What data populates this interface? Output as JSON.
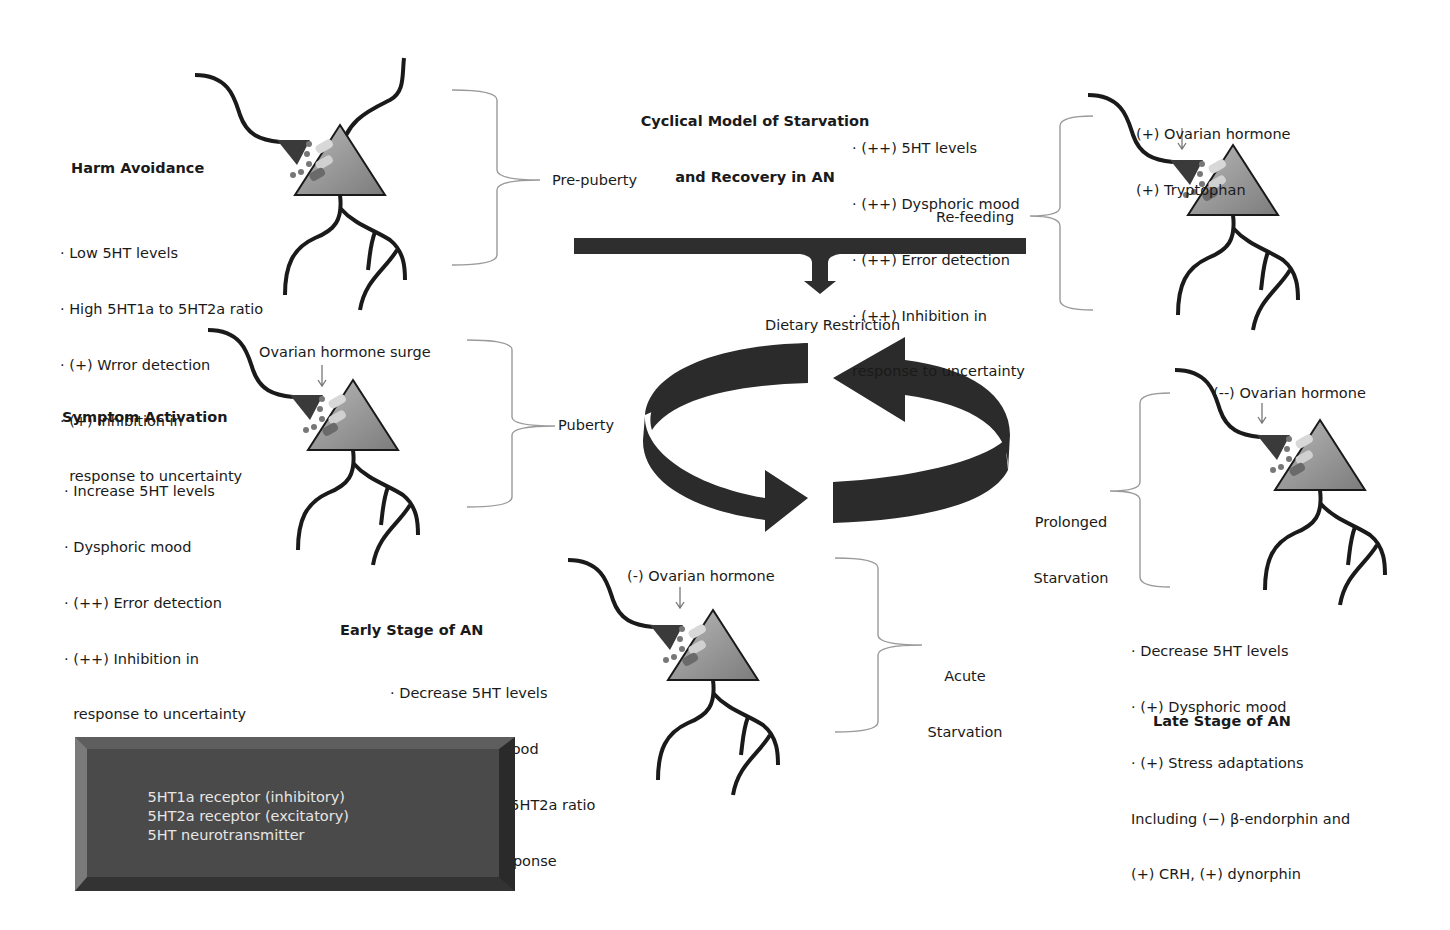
{
  "title": {
    "line1": "Cyclical Model of Starvation",
    "line2": "and Recovery in AN"
  },
  "harm_avoidance": {
    "heading": "Harm Avoidance",
    "items": [
      "· Low 5HT levels",
      "· High 5HT1a to 5HT2a ratio",
      "· (+) Wrror detection",
      "· (+) Inhibition in",
      "  response to uncertainty"
    ]
  },
  "symptom_activation": {
    "heading": "Symptom Activation",
    "hormone_label": "Ovarian hormone surge",
    "items": [
      "· Increase 5HT levels",
      "· Dysphoric mood",
      "· (++) Error detection",
      "· (++) Inhibition in",
      "  response to uncertainty"
    ]
  },
  "early_stage": {
    "heading": "Early Stage of AN",
    "hormone_label": "(-) Ovarian hormone",
    "items": [
      "· Decrease 5HT levels",
      "· (-) Dysphoric mood",
      "· (++) 5HT1a to 5HT2a ratio",
      "· (++) Opioid response"
    ]
  },
  "refeeding": {
    "hormone_line1": "(+) Ovarian hormone",
    "hormone_line2": "(+) Tryptophan",
    "items": [
      "· (++) 5HT levels",
      "· (++) Dysphoric mood",
      "· (++) Error detection",
      "· (++) Inhibition in",
      "response to uncertainty"
    ]
  },
  "late_stage": {
    "heading": "Late Stage of AN",
    "hormone_label": "(--) Ovarian hormone",
    "items": [
      "· Decrease 5HT levels",
      "· (+) Dysphoric mood",
      "· (+) Stress adaptations",
      "Including (−) β-endorphin and",
      "(+) CRH, (+) dynorphin"
    ]
  },
  "phases": {
    "pre_puberty": "Pre-puberty",
    "puberty": "Puberty",
    "acute_line1": "Acute",
    "acute_line2": "Starvation",
    "prolonged_line1": "Prolonged",
    "prolonged_line2": "Starvation",
    "refeeding": "Re-feeding"
  },
  "cycle": {
    "label": "Dietary Restriction"
  },
  "legend": {
    "items": [
      {
        "icon": "receptor-inhibitory-icon",
        "label": "5HT1a receptor (inhibitory)"
      },
      {
        "icon": "receptor-excitatory-icon",
        "label": "5HT2a receptor (excitatory)"
      },
      {
        "icon": "neurotransmitter-icon",
        "label": "5HT neurotransmitter"
      }
    ]
  },
  "colors": {
    "ink": "#1a1a1a",
    "arrow_dark": "#2b2b2b",
    "neuron_body": "#8c8c8c",
    "terminal": "#3a3a3a",
    "bracket": "#9a9a9a",
    "legend_bg": "#4a4a4a",
    "legend_text": "#e6e6e6"
  }
}
